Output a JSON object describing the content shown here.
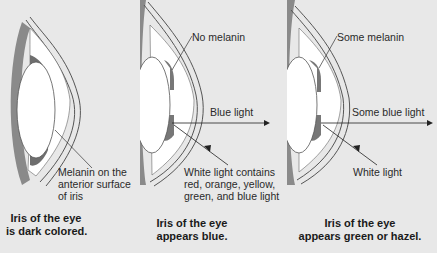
{
  "panels": [
    {
      "id": "dark",
      "labels": [
        "Melanin on the",
        "anterior surface",
        "of iris"
      ],
      "caption": [
        "Iris of the eye",
        "is dark colored."
      ]
    },
    {
      "id": "blue",
      "top_label": "No melanin",
      "arrow_label": "Blue light",
      "labels": [
        "White light contains",
        "red, orange, yellow,",
        "green, and blue light"
      ],
      "caption": [
        "Iris of the eye",
        "appears blue."
      ]
    },
    {
      "id": "green",
      "top_label": "Some melanin",
      "arrow_label": "Some blue light",
      "labels": [
        "White light"
      ],
      "caption": [
        "Iris of the eye",
        "appears green or hazel."
      ]
    }
  ],
  "colors": {
    "background": "#e8e8e8",
    "tissue": "#9a9a9a",
    "lens": "#ffffff",
    "line": "#333333"
  }
}
